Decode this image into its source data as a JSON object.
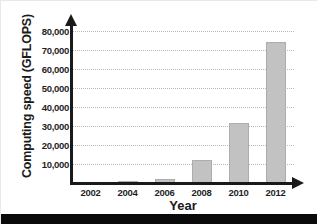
{
  "chart_data": {
    "type": "bar",
    "title": "",
    "xlabel": "Year",
    "ylabel": "Computing speed (GFLOPS)",
    "categories": [
      "2002",
      "2004",
      "2006",
      "2008",
      "2010",
      "2012"
    ],
    "values": [
      600,
      1100,
      2000,
      12000,
      31500,
      74000
    ],
    "ylim": [
      0,
      80000
    ],
    "ytick_values": [
      10000,
      20000,
      30000,
      40000,
      50000,
      60000,
      70000,
      80000
    ],
    "ytick_labels": [
      "10,000",
      "20,000",
      "30,000",
      "40,000",
      "50,000",
      "60,000",
      "70,000",
      "80,000"
    ],
    "grid": true,
    "grid_style": "dotted",
    "legend": "none",
    "bar_color": "#c2c2c2",
    "bar_edge_color": "#adadad",
    "axis_color": "#1a1a1a",
    "background": "#ffffff"
  },
  "figure": {
    "bottom_band_color": "#0a0a0a"
  }
}
